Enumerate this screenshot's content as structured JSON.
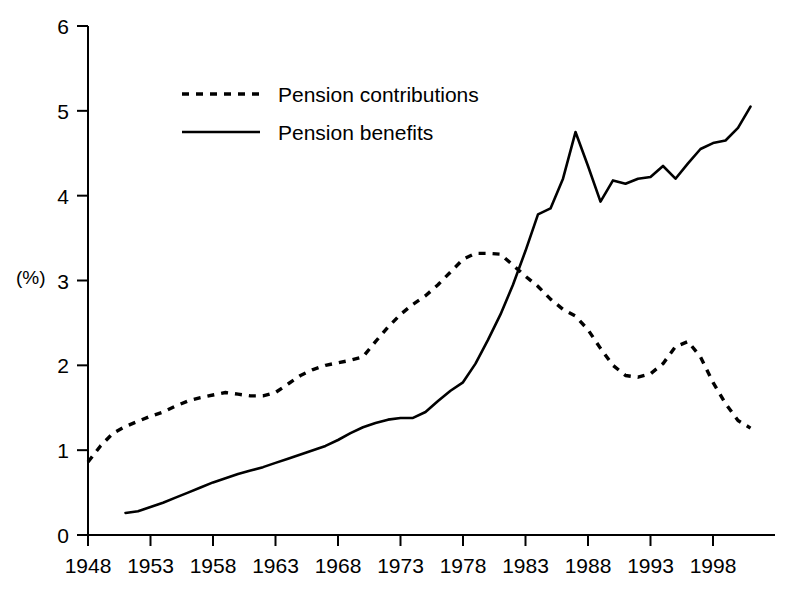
{
  "chart_data": {
    "type": "line",
    "title": "",
    "subtitle": "",
    "xlabel": "",
    "ylabel": "(%)",
    "xlim": [
      1948,
      2001
    ],
    "ylim": [
      0,
      6
    ],
    "grid": false,
    "legend_position": "upper-left-inside",
    "x_tick_labels": [
      "1948",
      "1953",
      "1958",
      "1963",
      "1968",
      "1973",
      "1978",
      "1983",
      "1988",
      "1993",
      "1998"
    ],
    "x_ticks": [
      1948,
      1953,
      1958,
      1963,
      1968,
      1973,
      1978,
      1983,
      1988,
      1993,
      1998
    ],
    "y_tick_labels": [
      "0",
      "1",
      "2",
      "3",
      "4",
      "5",
      "6"
    ],
    "y_ticks": [
      0,
      1,
      2,
      3,
      4,
      5,
      6
    ],
    "series": [
      {
        "name": "Pension contributions",
        "style": "dotted",
        "color": "#000000",
        "x": [
          1948,
          1949,
          1950,
          1951,
          1952,
          1953,
          1954,
          1955,
          1956,
          1957,
          1958,
          1959,
          1960,
          1961,
          1962,
          1963,
          1964,
          1965,
          1966,
          1967,
          1968,
          1969,
          1970,
          1971,
          1972,
          1973,
          1974,
          1975,
          1976,
          1977,
          1978,
          1979,
          1980,
          1981,
          1982,
          1983,
          1984,
          1985,
          1986,
          1987,
          1988,
          1989,
          1990,
          1991,
          1992,
          1993,
          1994,
          1995,
          1996,
          1997,
          1998,
          1999,
          2000,
          2001
        ],
        "values": [
          0.86,
          1.05,
          1.2,
          1.28,
          1.34,
          1.4,
          1.45,
          1.52,
          1.58,
          1.62,
          1.65,
          1.68,
          1.66,
          1.64,
          1.64,
          1.68,
          1.78,
          1.88,
          1.95,
          2.0,
          2.03,
          2.06,
          2.1,
          2.28,
          2.45,
          2.6,
          2.72,
          2.82,
          2.95,
          3.1,
          3.25,
          3.32,
          3.32,
          3.31,
          3.18,
          3.05,
          2.93,
          2.78,
          2.66,
          2.58,
          2.42,
          2.2,
          2.0,
          1.88,
          1.86,
          1.9,
          2.02,
          2.22,
          2.28,
          2.1,
          1.8,
          1.55,
          1.35,
          1.26
        ]
      },
      {
        "name": "Pension benefits",
        "style": "solid",
        "color": "#000000",
        "x": [
          1951,
          1952,
          1953,
          1954,
          1955,
          1956,
          1957,
          1958,
          1959,
          1960,
          1961,
          1962,
          1963,
          1964,
          1965,
          1966,
          1967,
          1968,
          1969,
          1970,
          1971,
          1972,
          1973,
          1974,
          1975,
          1976,
          1977,
          1978,
          1979,
          1980,
          1981,
          1982,
          1983,
          1984,
          1985,
          1986,
          1987,
          1988,
          1989,
          1990,
          1991,
          1992,
          1993,
          1994,
          1995,
          1996,
          1997,
          1998,
          1999,
          2000,
          2001
        ],
        "values": [
          0.26,
          0.28,
          0.33,
          0.38,
          0.44,
          0.5,
          0.56,
          0.62,
          0.67,
          0.72,
          0.76,
          0.8,
          0.85,
          0.9,
          0.95,
          1.0,
          1.05,
          1.12,
          1.2,
          1.27,
          1.32,
          1.36,
          1.38,
          1.38,
          1.45,
          1.58,
          1.7,
          1.8,
          2.02,
          2.3,
          2.6,
          2.95,
          3.35,
          3.78,
          3.85,
          4.2,
          4.75,
          4.35,
          3.93,
          4.18,
          4.14,
          4.2,
          4.22,
          4.35,
          4.2,
          4.38,
          4.55,
          4.62,
          4.65,
          4.8,
          5.05
        ]
      }
    ]
  },
  "axis": {
    "y_label": "(%)"
  },
  "legend": {
    "items": [
      {
        "label": "Pension contributions",
        "style": "dotted"
      },
      {
        "label": "Pension benefits",
        "style": "solid"
      }
    ]
  }
}
